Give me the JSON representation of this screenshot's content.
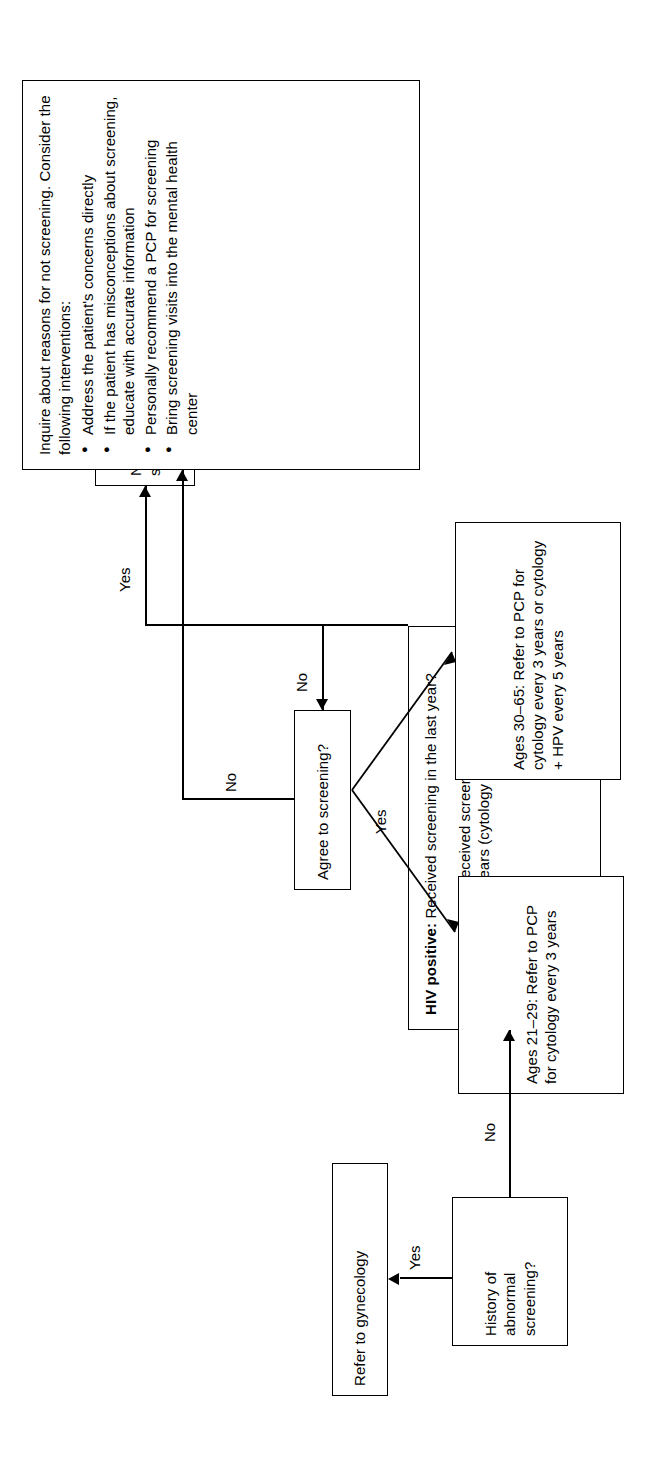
{
  "figure": {
    "kind": "clinical-decision-flowchart",
    "orientation": "rotated-90-ccw",
    "background": "#ffffff",
    "line_color": "#000000"
  },
  "nodes": {
    "history": {
      "id": "history-of-abnormal-screening",
      "lines": [
        "History of",
        "abnormal",
        "screening?"
      ]
    },
    "gynecology": {
      "id": "refer-to-gynecology",
      "text": "Refer to gynecology"
    },
    "screening_status": {
      "id": "screening-status-question",
      "para1_bold": "HIV positive:",
      "para1_rest": " Received screening in the last year?",
      "para2_bold": "Not HIV positive:",
      "para2_rest": " Received screening in last 3 years (cytology) or last 5 years (cytology + HPV)?"
    },
    "no_need": {
      "id": "no-need-for-screening",
      "text": "No need for screening currently"
    },
    "agree": {
      "id": "agree-to-screening-question",
      "text": "Agree to screening?"
    },
    "inquire": {
      "id": "inquire-about-reasons",
      "intro": "Inquire about reasons for not screening. Consider the following interventions:",
      "bullets": [
        "Address the patient's concerns directly",
        "If the patient has misconceptions about screening, educate with accurate information",
        "Personally recommend a PCP for screening",
        "Bring screening visits into the mental health center"
      ]
    },
    "ages_30_65": {
      "id": "ages-30-65-referral",
      "text": "Ages 30–65: Refer to PCP for cytology every 3 years or cytology + HPV every 5 years"
    },
    "ages_21_29": {
      "id": "ages-21-29-referral",
      "text": "Ages 21–29: Refer to PCP for cytology every 3 years"
    }
  },
  "edges": {
    "history_yes": "Yes",
    "history_no": "No",
    "screening_yes": "Yes",
    "screening_no": "No",
    "agree_no": "No",
    "agree_yes": "Yes"
  }
}
